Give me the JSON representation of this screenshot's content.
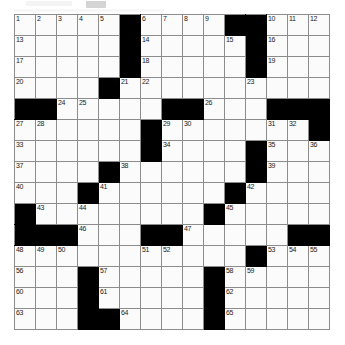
{
  "puzzle": {
    "title": "Crossword Grid",
    "columns": 15,
    "rows": 15,
    "cell_size_px": 21,
    "grid_origin": {
      "x": 14,
      "y": 14
    },
    "colors": {
      "block": "#000000",
      "cell": "#fbfbfb",
      "grid_line": "#8c8c8c",
      "number": "#1a1a1a",
      "page_background": "#ffffff"
    },
    "max_clue_number": 65,
    "legend": {
      "open_cell": "white fillable square",
      "blocked_cell": "black square"
    },
    "rows_layout": [
      {
        "index": 0,
        "blocks": [
          5,
          10,
          11
        ]
      },
      {
        "index": 1,
        "blocks": [
          5,
          11
        ]
      },
      {
        "index": 2,
        "blocks": [
          5,
          11
        ]
      },
      {
        "index": 3,
        "blocks": [
          4
        ]
      },
      {
        "index": 4,
        "blocks": [
          0,
          1,
          7,
          8,
          12,
          13,
          14
        ]
      },
      {
        "index": 5,
        "blocks": [
          6,
          14
        ]
      },
      {
        "index": 6,
        "blocks": [
          6,
          11
        ]
      },
      {
        "index": 7,
        "blocks": [
          4,
          11
        ]
      },
      {
        "index": 8,
        "blocks": [
          3,
          10
        ]
      },
      {
        "index": 9,
        "blocks": [
          0,
          9
        ]
      },
      {
        "index": 10,
        "blocks": [
          0,
          1,
          2,
          6,
          7,
          13,
          14
        ]
      },
      {
        "index": 11,
        "blocks": [
          11
        ]
      },
      {
        "index": 12,
        "blocks": [
          3,
          9
        ]
      },
      {
        "index": 13,
        "blocks": [
          3,
          9
        ]
      },
      {
        "index": 14,
        "blocks": [
          3,
          4,
          9
        ]
      }
    ],
    "numbers": [
      {
        "n": 1,
        "row": 0,
        "col": 0
      },
      {
        "n": 2,
        "row": 0,
        "col": 1
      },
      {
        "n": 3,
        "row": 0,
        "col": 2
      },
      {
        "n": 4,
        "row": 0,
        "col": 3
      },
      {
        "n": 5,
        "row": 0,
        "col": 4
      },
      {
        "n": 6,
        "row": 0,
        "col": 6
      },
      {
        "n": 7,
        "row": 0,
        "col": 7
      },
      {
        "n": 8,
        "row": 0,
        "col": 8
      },
      {
        "n": 9,
        "row": 0,
        "col": 9
      },
      {
        "n": 10,
        "row": 0,
        "col": 12
      },
      {
        "n": 11,
        "row": 0,
        "col": 13
      },
      {
        "n": 12,
        "row": 0,
        "col": 14
      },
      {
        "n": 13,
        "row": 1,
        "col": 0
      },
      {
        "n": 14,
        "row": 1,
        "col": 6
      },
      {
        "n": 15,
        "row": 1,
        "col": 10
      },
      {
        "n": 16,
        "row": 1,
        "col": 12
      },
      {
        "n": 17,
        "row": 2,
        "col": 0
      },
      {
        "n": 18,
        "row": 2,
        "col": 6
      },
      {
        "n": 19,
        "row": 2,
        "col": 12
      },
      {
        "n": 20,
        "row": 3,
        "col": 0
      },
      {
        "n": 21,
        "row": 3,
        "col": 5
      },
      {
        "n": 22,
        "row": 3,
        "col": 6
      },
      {
        "n": 23,
        "row": 3,
        "col": 11
      },
      {
        "n": 24,
        "row": 4,
        "col": 2
      },
      {
        "n": 25,
        "row": 4,
        "col": 3
      },
      {
        "n": 26,
        "row": 4,
        "col": 9
      },
      {
        "n": 27,
        "row": 5,
        "col": 0
      },
      {
        "n": 28,
        "row": 5,
        "col": 1
      },
      {
        "n": 29,
        "row": 5,
        "col": 7
      },
      {
        "n": 30,
        "row": 5,
        "col": 8
      },
      {
        "n": 31,
        "row": 5,
        "col": 12
      },
      {
        "n": 32,
        "row": 5,
        "col": 13
      },
      {
        "n": 33,
        "row": 6,
        "col": 0
      },
      {
        "n": 34,
        "row": 6,
        "col": 7
      },
      {
        "n": 35,
        "row": 6,
        "col": 12
      },
      {
        "n": 36,
        "row": 6,
        "col": 14
      },
      {
        "n": 37,
        "row": 7,
        "col": 0
      },
      {
        "n": 38,
        "row": 7,
        "col": 5
      },
      {
        "n": 39,
        "row": 7,
        "col": 12
      },
      {
        "n": 40,
        "row": 8,
        "col": 0
      },
      {
        "n": 41,
        "row": 8,
        "col": 4
      },
      {
        "n": 42,
        "row": 8,
        "col": 11
      },
      {
        "n": 43,
        "row": 9,
        "col": 1
      },
      {
        "n": 44,
        "row": 9,
        "col": 3
      },
      {
        "n": 45,
        "row": 9,
        "col": 10
      },
      {
        "n": 46,
        "row": 10,
        "col": 3
      },
      {
        "n": 47,
        "row": 10,
        "col": 8
      },
      {
        "n": 48,
        "row": 11,
        "col": 0
      },
      {
        "n": 49,
        "row": 11,
        "col": 1
      },
      {
        "n": 50,
        "row": 11,
        "col": 2
      },
      {
        "n": 51,
        "row": 11,
        "col": 6
      },
      {
        "n": 52,
        "row": 11,
        "col": 7
      },
      {
        "n": 53,
        "row": 11,
        "col": 12
      },
      {
        "n": 54,
        "row": 11,
        "col": 13
      },
      {
        "n": 55,
        "row": 11,
        "col": 14
      },
      {
        "n": 56,
        "row": 12,
        "col": 0
      },
      {
        "n": 57,
        "row": 12,
        "col": 4
      },
      {
        "n": 58,
        "row": 12,
        "col": 10
      },
      {
        "n": 59,
        "row": 12,
        "col": 11
      },
      {
        "n": 60,
        "row": 13,
        "col": 0
      },
      {
        "n": 61,
        "row": 13,
        "col": 4
      },
      {
        "n": 62,
        "row": 13,
        "col": 10
      },
      {
        "n": 63,
        "row": 14,
        "col": 0
      },
      {
        "n": 64,
        "row": 14,
        "col": 5
      },
      {
        "n": 65,
        "row": 14,
        "col": 10
      }
    ]
  }
}
